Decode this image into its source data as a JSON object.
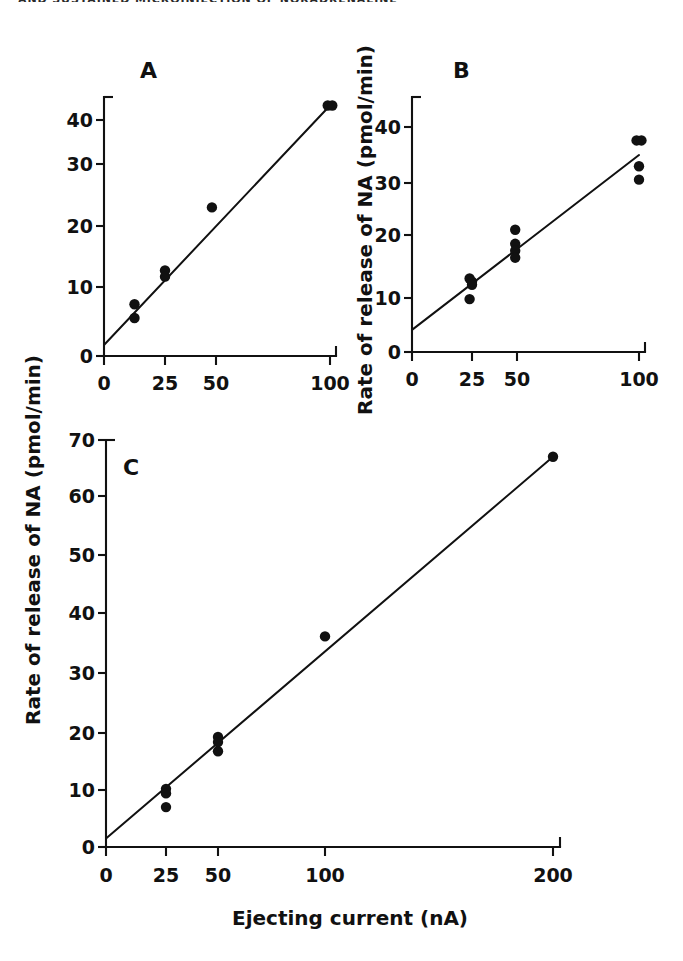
{
  "page": {
    "running_head": "AND SUSTAINED MICROINJECTION OF NORADRENALINE",
    "background_color": "#ffffff",
    "ink_color": "#111111"
  },
  "axis_titles": {
    "y": "Rate of release of NA (pmol/min)",
    "x": "Ejecting current (nA)"
  },
  "panels": {
    "a": {
      "letter": "A"
    },
    "b": {
      "letter": "B"
    },
    "c": {
      "letter": "C"
    }
  },
  "ticks": {
    "panel_a_y": [
      "0",
      "10",
      "20",
      "30",
      "40"
    ],
    "panel_a_x": [
      "0",
      "25",
      "50",
      "100"
    ],
    "panel_b_y": [
      "0",
      "10",
      "20",
      "30",
      "40"
    ],
    "panel_b_x": [
      "0",
      "25",
      "50",
      "100"
    ],
    "panel_c_y": [
      "0",
      "10",
      "20",
      "30",
      "40",
      "50",
      "60",
      "70"
    ],
    "panel_c_x": [
      "0",
      "25",
      "50",
      "100",
      "200"
    ]
  },
  "chart_data": [
    {
      "type": "scatter",
      "title": "A",
      "xlabel": "Ejecting current (nA)",
      "ylabel": "Rate of release of NA (pmol/min)",
      "xlim": [
        0,
        100
      ],
      "ylim": [
        0,
        45
      ],
      "xticks": [
        0,
        25,
        50,
        100
      ],
      "yticks": [
        0,
        10,
        20,
        30,
        40
      ],
      "grid": false,
      "legend": "none",
      "points": [
        {
          "x": 12.5,
          "y": 7.5
        },
        {
          "x": 12.5,
          "y": 5.5
        },
        {
          "x": 25,
          "y": 12.7
        },
        {
          "x": 25,
          "y": 11.7
        },
        {
          "x": 48,
          "y": 23.0
        },
        {
          "x": 99,
          "y": 43.3
        },
        {
          "x": 101,
          "y": 43.3
        }
      ],
      "fit_line": {
        "x0": 0,
        "y0": 1.6,
        "x1": 100,
        "y1": 43.3
      }
    },
    {
      "type": "scatter",
      "title": "B",
      "xlabel": "Ejecting current (nA)",
      "ylabel": "Rate of release of NA (pmol/min)",
      "xlim": [
        0,
        100
      ],
      "ylim": [
        0,
        45
      ],
      "xticks": [
        0,
        25,
        50,
        100
      ],
      "yticks": [
        0,
        10,
        20,
        30,
        40
      ],
      "grid": false,
      "legend": "none",
      "points": [
        {
          "x": 24,
          "y": 13.1
        },
        {
          "x": 25,
          "y": 12.6
        },
        {
          "x": 25,
          "y": 12.1
        },
        {
          "x": 24,
          "y": 9.8
        },
        {
          "x": 49,
          "y": 21.0
        },
        {
          "x": 49,
          "y": 18.6
        },
        {
          "x": 49,
          "y": 17.5
        },
        {
          "x": 49,
          "y": 16.4
        },
        {
          "x": 99,
          "y": 37.6
        },
        {
          "x": 101,
          "y": 37.6
        },
        {
          "x": 100,
          "y": 33.0
        },
        {
          "x": 100,
          "y": 30.6
        }
      ],
      "fit_line": {
        "x0": 0,
        "y0": 4.1,
        "x1": 100,
        "y1": 35.0
      }
    },
    {
      "type": "scatter",
      "title": "C",
      "xlabel": "Ejecting current (nA)",
      "ylabel": "Rate of release of NA (pmol/min)",
      "xlim": [
        0,
        200
      ],
      "ylim": [
        0,
        72
      ],
      "xticks": [
        0,
        25,
        50,
        100,
        200
      ],
      "yticks": [
        0,
        10,
        20,
        30,
        40,
        50,
        60,
        70
      ],
      "grid": false,
      "legend": "none",
      "points": [
        {
          "x": 25,
          "y": 10.2
        },
        {
          "x": 25,
          "y": 9.4
        },
        {
          "x": 25,
          "y": 7.0
        },
        {
          "x": 50,
          "y": 19.3
        },
        {
          "x": 50,
          "y": 18.4
        },
        {
          "x": 50,
          "y": 16.8
        },
        {
          "x": 100,
          "y": 36.1
        },
        {
          "x": 200,
          "y": 67.0
        }
      ],
      "fit_line": {
        "x0": 0,
        "y0": 1.5,
        "x1": 200,
        "y1": 67.0
      }
    }
  ]
}
